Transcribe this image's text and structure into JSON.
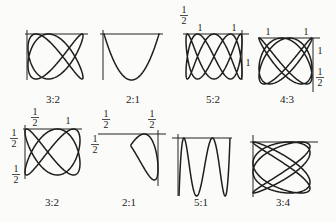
{
  "figure": {
    "stroke_color": "#1e1e1e",
    "background": "#fbfbf9",
    "panels": [
      {
        "id": "p1",
        "ratio": "3:2",
        "label_pos": [
          53,
          103
        ],
        "axes": {
          "h": [
            25,
            34,
            88,
            34
          ],
          "v": [
            27,
            30,
            27,
            80
          ]
        },
        "box": [
          28,
          34,
          83,
          79
        ],
        "a": 3,
        "b": 2,
        "phase": 0.0,
        "yFlip": false,
        "mode": "lissajous",
        "ticks": []
      },
      {
        "id": "p2",
        "ratio": "2:1",
        "label_pos": [
          133,
          103
        ],
        "axes": {
          "h": [
            100,
            34,
            163,
            34
          ],
          "v": [
            103,
            30,
            103,
            80
          ]
        },
        "box": [
          104,
          34,
          159,
          80
        ],
        "a": 2,
        "b": 1,
        "phase": 0.0,
        "yFlip": false,
        "mode": "lissajous2",
        "ticks": []
      },
      {
        "id": "p3",
        "ratio": "5:2",
        "label_pos": [
          213,
          103
        ],
        "axes": {
          "h": [
            183,
            34,
            249,
            34
          ],
          "v": [
            242,
            30,
            242,
            80
          ]
        },
        "box": [
          186,
          34,
          242,
          79
        ],
        "a": 5,
        "b": 2,
        "phase": 0.0,
        "mode": "lissajous52",
        "ticks": [
          {
            "type": "frac",
            "x": 184,
            "y": 14,
            "num": "1",
            "den": "2"
          },
          {
            "type": "int",
            "x": 200,
            "y": 31,
            "text": "1"
          },
          {
            "type": "int",
            "x": 234,
            "y": 31,
            "text": "1"
          },
          {
            "type": "int",
            "x": 248,
            "y": 66,
            "text": "1"
          }
        ]
      },
      {
        "id": "p4",
        "ratio": "4:3",
        "label_pos": [
          287,
          103
        ],
        "axes": {
          "h": [
            258,
            38,
            320,
            38
          ],
          "v": [
            313,
            38,
            313,
            92
          ]
        },
        "box": [
          259,
          38,
          312,
          84
        ],
        "a": 4,
        "b": 3,
        "mode": "lissajous43",
        "ticks": [
          {
            "type": "int",
            "x": 268,
            "y": 35,
            "text": "1"
          },
          {
            "type": "int",
            "x": 306,
            "y": 35,
            "text": "1"
          },
          {
            "type": "int",
            "x": 320,
            "y": 54,
            "text": "1"
          },
          {
            "type": "frac",
            "x": 320,
            "y": 76,
            "num": "1",
            "den": "2"
          }
        ]
      },
      {
        "id": "p5",
        "ratio": "3:2",
        "label_pos": [
          52,
          206
        ],
        "axes": {
          "h": [
            23,
            129,
            82,
            129
          ],
          "v": [
            25,
            125,
            25,
            179
          ]
        },
        "box": [
          25,
          129,
          80,
          175
        ],
        "a": 3,
        "b": 2,
        "mode": "fish",
        "ticks": [
          {
            "type": "frac",
            "x": 35,
            "y": 116,
            "num": "1",
            "den": "2"
          },
          {
            "type": "int",
            "x": 68,
            "y": 124,
            "text": "1"
          },
          {
            "type": "frac",
            "x": 14,
            "y": 137,
            "num": "1",
            "den": "2"
          },
          {
            "type": "frac",
            "x": 16,
            "y": 173,
            "num": "1",
            "den": "2"
          }
        ]
      },
      {
        "id": "p6",
        "ratio": "2:1",
        "label_pos": [
          129,
          206
        ],
        "axes": {
          "h": [
            98,
            134,
            166,
            134
          ],
          "v": [
            158,
            130,
            158,
            186
          ]
        },
        "box": [
          103,
          134,
          158,
          180
        ],
        "a": 2,
        "b": 1,
        "mode": "parabola",
        "ticks": [
          {
            "type": "frac",
            "x": 106,
            "y": 118,
            "num": "1",
            "den": "2"
          },
          {
            "type": "frac",
            "x": 152,
            "y": 118,
            "num": "1",
            "den": "2"
          },
          {
            "type": "frac",
            "x": 95,
            "y": 143,
            "num": "1",
            "den": "2"
          }
        ]
      },
      {
        "id": "p7",
        "ratio": "5:1",
        "label_pos": [
          201,
          206
        ],
        "axes": {
          "h": [
            172,
            138,
            232,
            138
          ],
          "v": [
            178,
            134,
            178,
            196
          ]
        },
        "box": [
          179,
          138,
          230,
          196
        ],
        "a": 5,
        "b": 1,
        "mode": "wave",
        "ticks": []
      },
      {
        "id": "p8",
        "ratio": "3:4",
        "label_pos": [
          283,
          206
        ],
        "axes": {
          "h": [
            250,
            142,
            318,
            142
          ],
          "v": [
            253,
            135,
            253,
            197
          ]
        },
        "box": [
          253,
          142,
          310,
          193
        ],
        "a": 3,
        "b": 4,
        "mode": "lissajous34",
        "ticks": []
      }
    ]
  }
}
